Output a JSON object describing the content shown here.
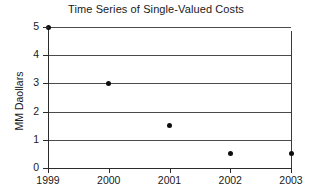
{
  "chart_data": {
    "type": "scatter",
    "title": "Time Series of Single-Valued Costs",
    "xlabel": "",
    "ylabel": "MM Daollars",
    "categories": [
      "1999",
      "2000",
      "2001",
      "2002",
      "2003"
    ],
    "values": [
      5.0,
      3.0,
      1.5,
      0.5,
      0.5
    ],
    "series": [
      {
        "name": "Cost",
        "values": [
          5.0,
          3.0,
          1.5,
          0.5,
          0.5
        ]
      }
    ],
    "ylim": [
      0,
      5
    ],
    "xlim": [
      "1999",
      "2003"
    ],
    "ytick_labels": [
      "0",
      "1",
      "2",
      "3",
      "4",
      "5"
    ],
    "ytick_values": [
      0,
      1,
      2,
      3,
      4,
      5
    ],
    "xtick_labels": [
      "1999",
      "2000",
      "2001",
      "2002",
      "2003"
    ],
    "grid": "horizontal",
    "legend": "none",
    "marker": "filled-circle",
    "marker_color": "#0d0d0d",
    "gridline_color": "#4a4a4a",
    "axis_color": "#2b2b2b",
    "background_color": "#ffffff",
    "annotations": [
      {
        "name": "vertical-range-line-2003",
        "category": "2003",
        "y_top": 4.85,
        "y_bottom": 0.0
      }
    ]
  }
}
